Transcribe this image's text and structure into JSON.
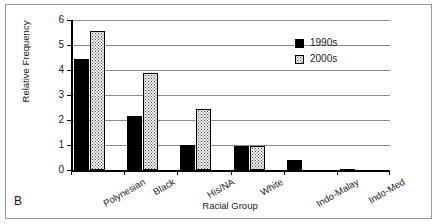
{
  "figure": {
    "panel_label": "B",
    "border_color": "#9a9a9a",
    "background": "#ffffff"
  },
  "legend": {
    "position": "top-right",
    "entries": [
      {
        "label": "1990s",
        "color": "#000000",
        "swatch": "solid-black-square"
      },
      {
        "label": "2000s",
        "color": "#f2f2f2",
        "swatch": "stippled-square"
      }
    ]
  },
  "axes": {
    "y_ticks": [
      "0",
      "1",
      "2",
      "3",
      "4",
      "5",
      "6"
    ],
    "x_tick_count": 7
  },
  "chart_data": {
    "type": "bar",
    "title": "",
    "xlabel": "Racial Group",
    "ylabel": "Relative Frequency",
    "categories": [
      "Polynesian",
      "Black",
      "His/NA",
      "White",
      "Indo-Malay",
      "Indo-Med"
    ],
    "series": [
      {
        "name": "1990s",
        "color": "#000000",
        "values": [
          4.45,
          2.17,
          1.0,
          0.95,
          0.42,
          0.05
        ]
      },
      {
        "name": "2000s",
        "color": "#f2f2f2",
        "values": [
          5.55,
          3.87,
          2.45,
          0.95,
          0,
          0
        ]
      }
    ],
    "ylim": [
      0,
      6
    ],
    "ytick_step": 1,
    "grid": "horizontal",
    "legend_position": "top-right"
  }
}
